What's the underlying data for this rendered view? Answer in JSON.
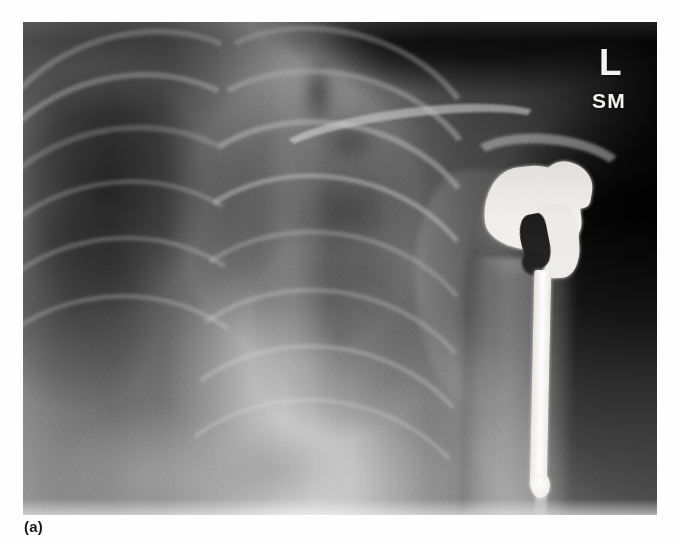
{
  "figure": {
    "label": "(a)",
    "caption_position": "bottom-left"
  },
  "radiograph": {
    "modality": "X-ray",
    "view": "AP chest / shoulder",
    "markers": {
      "side_label": "L",
      "initials_label": "SM"
    },
    "anatomy": [
      {
        "name": "clavicle",
        "label": "clavicle"
      },
      {
        "name": "acromion",
        "label": "acromion"
      },
      {
        "name": "scapula",
        "label": "scapula"
      },
      {
        "name": "glenoid",
        "label": "glenoid"
      },
      {
        "name": "humerus-shaft",
        "label": "humeral shaft"
      },
      {
        "name": "rib-cage",
        "label": "rib cage"
      },
      {
        "name": "lung-field-right",
        "label": "right lung field"
      },
      {
        "name": "lung-field-left",
        "label": "left lung field"
      },
      {
        "name": "mediastinum",
        "label": "mediastinum"
      },
      {
        "name": "diaphragm",
        "label": "diaphragm"
      }
    ],
    "implant": {
      "name": "shoulder-hemiarthroplasty-prosthesis",
      "components": [
        {
          "name": "humeral-head",
          "label": "humeral head component"
        },
        {
          "name": "humeral-neck",
          "label": "neck / collar"
        },
        {
          "name": "intramedullary-stem",
          "label": "intramedullary stem"
        },
        {
          "name": "stem-tip",
          "label": "stem tip"
        }
      ]
    },
    "ribs": [
      {
        "left": -40,
        "top": 10,
        "width": 290,
        "height": 210,
        "rot": -16,
        "bw": 6,
        "soft": false
      },
      {
        "left": -52,
        "top": 52,
        "width": 300,
        "height": 230,
        "rot": -14,
        "bw": 6,
        "soft": false
      },
      {
        "left": -60,
        "top": 104,
        "width": 312,
        "height": 250,
        "rot": -12,
        "bw": 6,
        "soft": true
      },
      {
        "left": -66,
        "top": 158,
        "width": 318,
        "height": 262,
        "rot": -10,
        "bw": 5,
        "soft": true
      },
      {
        "left": -70,
        "top": 214,
        "width": 322,
        "height": 268,
        "rot": -8,
        "bw": 5,
        "soft": true
      },
      {
        "left": -74,
        "top": 272,
        "width": 326,
        "height": 272,
        "rot": -6,
        "bw": 5,
        "soft": true
      },
      {
        "left": 150,
        "top": 6,
        "width": 300,
        "height": 216,
        "rot": 14,
        "bw": 6,
        "soft": false
      },
      {
        "left": 142,
        "top": 48,
        "width": 312,
        "height": 236,
        "rot": 12,
        "bw": 6,
        "soft": false
      },
      {
        "left": 134,
        "top": 98,
        "width": 322,
        "height": 256,
        "rot": 10,
        "bw": 6,
        "soft": false
      },
      {
        "left": 128,
        "top": 152,
        "width": 330,
        "height": 270,
        "rot": 9,
        "bw": 5,
        "soft": false
      },
      {
        "left": 124,
        "top": 208,
        "width": 336,
        "height": 280,
        "rot": 8,
        "bw": 5,
        "soft": true
      },
      {
        "left": 120,
        "top": 266,
        "width": 340,
        "height": 288,
        "rot": 7,
        "bw": 5,
        "soft": true
      },
      {
        "left": 116,
        "top": 322,
        "width": 344,
        "height": 294,
        "rot": 6,
        "bw": 5,
        "soft": true
      },
      {
        "left": 112,
        "top": 376,
        "width": 348,
        "height": 300,
        "rot": 5,
        "bw": 4,
        "soft": true
      }
    ],
    "blobs": [
      {
        "name": "trachea-shadow",
        "left": 278,
        "top": 36,
        "width": 34,
        "height": 70,
        "color": "rgba(0,0,0,0.45)",
        "blur": 5,
        "radius": "40%"
      },
      {
        "name": "aortic-knob",
        "left": 300,
        "top": 96,
        "width": 56,
        "height": 46,
        "color": "rgba(0,0,0,0.32)",
        "blur": 6,
        "radius": "50%"
      },
      {
        "name": "hilar-vessels",
        "left": 286,
        "top": 150,
        "width": 78,
        "height": 82,
        "color": "rgba(0,0,0,0.30)",
        "blur": 7,
        "radius": "50%"
      },
      {
        "name": "spine-column",
        "left": 238,
        "top": 30,
        "width": 64,
        "height": 420,
        "color": "rgba(214,214,214,0.24)",
        "blur": 6,
        "radius": "14%"
      },
      {
        "name": "heart-border",
        "left": 150,
        "top": 250,
        "width": 170,
        "height": 200,
        "color": "rgba(226,226,226,0.22)",
        "blur": 9,
        "radius": "54% 40% 46% 56%"
      },
      {
        "name": "diaphragm-right",
        "left": 30,
        "top": 392,
        "width": 200,
        "height": 130,
        "color": "rgba(236,236,236,0.26)",
        "blur": 10,
        "radius": "56% 60% 12% 12%"
      },
      {
        "name": "diaphragm-left",
        "left": 236,
        "top": 404,
        "width": 210,
        "height": 120,
        "color": "rgba(232,232,232,0.22)",
        "blur": 10,
        "radius": "52% 56% 12% 12%"
      },
      {
        "name": "apex-soft-tissue",
        "left": 6,
        "top": 2,
        "width": 150,
        "height": 90,
        "color": "rgba(200,200,200,0.18)",
        "blur": 8,
        "radius": "40%"
      },
      {
        "name": "neck-soft-tissue",
        "left": 300,
        "top": -10,
        "width": 130,
        "height": 80,
        "color": "rgba(0,0,0,0.40)",
        "blur": 9,
        "radius": "50%"
      },
      {
        "name": "axilla-shadow",
        "left": 520,
        "top": 250,
        "width": 150,
        "height": 230,
        "color": "rgba(0,0,0,0.55)",
        "blur": 12,
        "radius": "48%"
      },
      {
        "name": "lateral-chest-wall",
        "left": 400,
        "top": 330,
        "width": 120,
        "height": 180,
        "color": "rgba(222,222,222,0.16)",
        "blur": 9,
        "radius": "30% 40% 30% 20%"
      },
      {
        "name": "gas-shadow",
        "left": 196,
        "top": 410,
        "width": 120,
        "height": 80,
        "color": "rgba(0,0,0,0.24)",
        "blur": 9,
        "radius": "48%"
      },
      {
        "name": "scapula-tip",
        "left": 404,
        "top": 300,
        "width": 64,
        "height": 110,
        "color": "rgba(190,190,190,0.20)",
        "blur": 7,
        "radius": "40% 20% 30% 50%"
      }
    ]
  }
}
